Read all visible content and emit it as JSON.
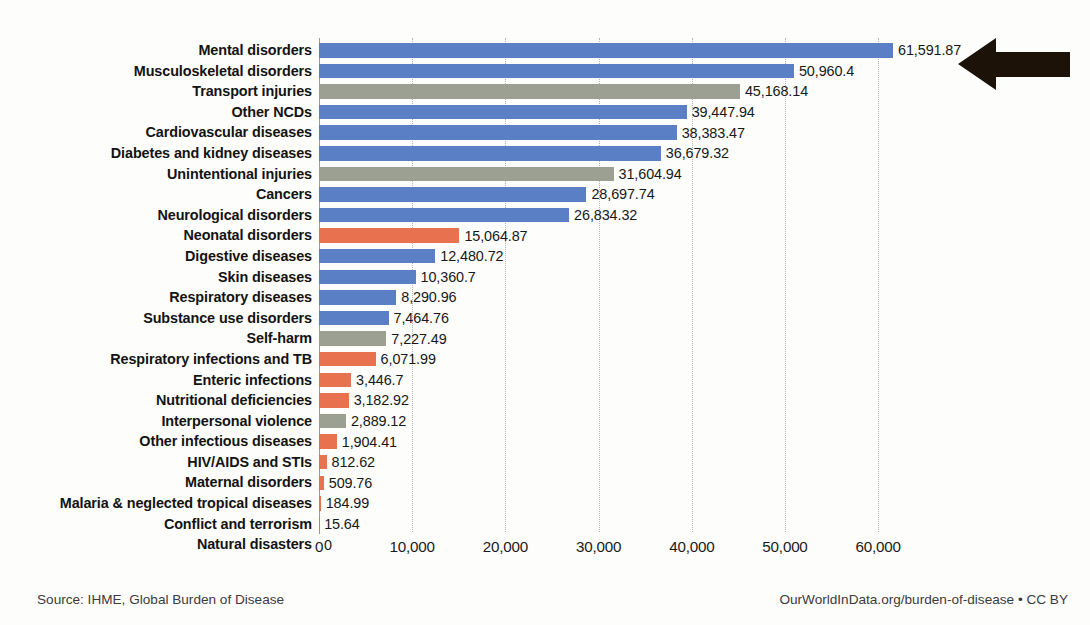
{
  "chart_data": {
    "type": "bar",
    "orientation": "horizontal",
    "title": "",
    "xlabel": "",
    "ylabel": "",
    "xlim": [
      0,
      65000
    ],
    "xticks": [
      "0",
      "10,000",
      "20,000",
      "30,000",
      "40,000",
      "50,000",
      "60,000"
    ],
    "xtick_values": [
      0,
      10000,
      20000,
      30000,
      40000,
      50000,
      60000
    ],
    "grid": true,
    "legend": "none",
    "categories": [
      "Mental disorders",
      "Musculoskeletal disorders",
      "Transport injuries",
      "Other NCDs",
      "Cardiovascular diseases",
      "Diabetes and kidney diseases",
      "Unintentional injuries",
      "Cancers",
      "Neurological disorders",
      "Neonatal disorders",
      "Digestive diseases",
      "Skin diseases",
      "Respiratory diseases",
      "Substance use disorders",
      "Self-harm",
      "Respiratory infections and TB",
      "Enteric infections",
      "Nutritional deficiencies",
      "Interpersonal violence",
      "Other infectious diseases",
      "HIV/AIDS and STIs",
      "Maternal disorders",
      "Malaria & neglected tropical diseases",
      "Conflict and terrorism",
      "Natural disasters"
    ],
    "values": [
      61591.87,
      50960.4,
      45168.14,
      39447.94,
      38383.47,
      36679.32,
      31604.94,
      28697.74,
      26834.32,
      15064.87,
      12480.72,
      10360.7,
      8290.96,
      7464.76,
      7227.49,
      6071.99,
      3446.7,
      3182.92,
      2889.12,
      1904.41,
      812.62,
      509.76,
      184.99,
      15.64,
      0
    ],
    "value_labels": [
      "61,591.87",
      "50,960.4",
      "45,168.14",
      "39,447.94",
      "38,383.47",
      "36,679.32",
      "31,604.94",
      "28,697.74",
      "26,834.32",
      "15,064.87",
      "12,480.72",
      "10,360.7",
      "8,290.96",
      "7,464.76",
      "7,227.49",
      "6,071.99",
      "3,446.7",
      "3,182.92",
      "2,889.12",
      "1,904.41",
      "812.62",
      "509.76",
      "184.99",
      "15.64",
      "0"
    ],
    "bar_colors": [
      "#5b7fc4",
      "#5b7fc4",
      "#9ba093",
      "#5b7fc4",
      "#5b7fc4",
      "#5b7fc4",
      "#9ba093",
      "#5b7fc4",
      "#5b7fc4",
      "#e8714f",
      "#5b7fc4",
      "#5b7fc4",
      "#5b7fc4",
      "#5b7fc4",
      "#9ba093",
      "#e8714f",
      "#e8714f",
      "#e8714f",
      "#9ba093",
      "#e8714f",
      "#e8714f",
      "#e8714f",
      "#e8714f",
      "#e8714f",
      "#e8714f"
    ],
    "colors": {
      "non_communicable": "#5b7fc4",
      "injuries": "#9ba093",
      "communicable": "#e8714f",
      "annotation_arrow": "#1c1208",
      "gridline": "#b4b4b4",
      "axis": "#9a9a9a",
      "background": "#fdfdfb"
    }
  },
  "footer": {
    "source": "Source: IHME, Global Burden of Disease",
    "credit": "OurWorldInData.org/burden-of-disease • CC BY"
  },
  "annotation": {
    "arrow_name": "left-pointing-arrow",
    "points_to": "Mental disorders"
  }
}
